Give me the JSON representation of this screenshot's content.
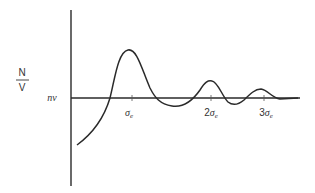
{
  "diagram": {
    "y_label": {
      "numerator": "N",
      "denominator": "V"
    },
    "baseline_label": "nν",
    "ticks": [
      {
        "label_main": "σ",
        "label_sub": "e",
        "prefix": ""
      },
      {
        "label_main": "σ",
        "label_sub": "e",
        "prefix": "2"
      },
      {
        "label_main": "σ",
        "label_sub": "e",
        "prefix": "3"
      }
    ]
  }
}
